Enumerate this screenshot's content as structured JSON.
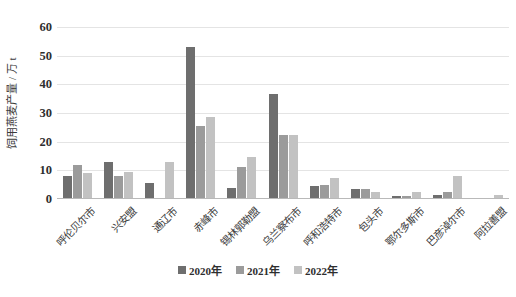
{
  "chart_data": {
    "type": "bar",
    "title": "",
    "xlabel": "",
    "ylabel": "饲用燕麦产量 / 万 t",
    "ylim": [
      0,
      60
    ],
    "yticks": [
      0,
      10,
      20,
      30,
      40,
      50,
      60
    ],
    "grid": true,
    "legend_position": "bottom",
    "categories": [
      "呼伦贝尔市",
      "兴安盟",
      "通辽市",
      "赤峰市",
      "锡林郭勒盟",
      "乌兰察布市",
      "呼和浩特市",
      "包头市",
      "鄂尔多斯市",
      "巴彦淖尔市",
      "阿拉善盟"
    ],
    "series": [
      {
        "name": "2020年",
        "color": "#6e6e6e",
        "values": [
          8.0,
          13.0,
          5.5,
          53.0,
          4.0,
          36.5,
          4.5,
          3.5,
          1.0,
          1.5,
          0.0
        ]
      },
      {
        "name": "2021年",
        "color": "#9b9b9b",
        "values": [
          11.8,
          8.0,
          0.5,
          25.5,
          11.0,
          22.5,
          5.0,
          3.5,
          1.2,
          2.5,
          0.3
        ]
      },
      {
        "name": "2022年",
        "color": "#c2c2c2",
        "values": [
          9.2,
          9.5,
          13.0,
          28.7,
          14.5,
          22.5,
          7.5,
          2.5,
          2.5,
          8.0,
          1.5
        ]
      }
    ]
  }
}
